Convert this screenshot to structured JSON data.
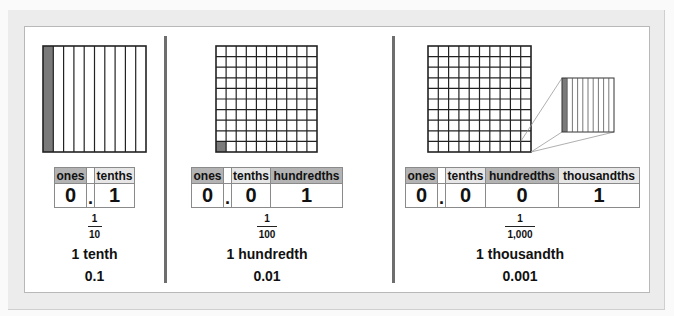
{
  "panels": [
    {
      "model": "tenths-strip",
      "headers": [
        "ones",
        "",
        "tenths"
      ],
      "values": [
        "0",
        ".",
        "1"
      ],
      "fraction": {
        "numerator": "1",
        "denominator": "10"
      },
      "word": "1 tenth",
      "decimal": "0.1"
    },
    {
      "model": "hundredths-grid",
      "headers": [
        "ones",
        "",
        "tenths",
        "hundredths"
      ],
      "values": [
        "0",
        ".",
        "0",
        "1"
      ],
      "fraction": {
        "numerator": "1",
        "denominator": "100"
      },
      "word": "1 hundredth",
      "decimal": "0.01"
    },
    {
      "model": "thousandths-grid-with-zoom",
      "headers": [
        "ones",
        "",
        "tenths",
        "hundredths",
        "thousandths"
      ],
      "values": [
        "0",
        ".",
        "0",
        "0",
        "1"
      ],
      "fraction": {
        "numerator": "1",
        "denominator": "1,000"
      },
      "word": "1 thousandth",
      "decimal": "0.001"
    }
  ],
  "colors": {
    "shaded": "#7a7a7a",
    "header_dark": "#b3b3b3",
    "header_light": "#e6e6e6",
    "divider": "#6e6e6e"
  }
}
